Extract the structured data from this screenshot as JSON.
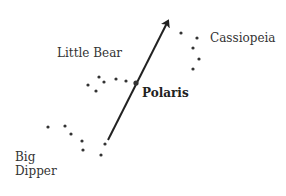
{
  "diagram": {
    "labels": {
      "cassiopeia": "Cassiopeia",
      "little_bear": "Little Bear",
      "polaris": "Polaris",
      "big_dipper_line1": "Big",
      "big_dipper_line2": "Dipper"
    },
    "arrow": {
      "from": [
        108,
        140
      ],
      "to": [
        170,
        17
      ],
      "color": "#222222"
    },
    "constellations": {
      "cassiopeia": [
        [
          181,
          33
        ],
        [
          197,
          38
        ],
        [
          193,
          48
        ],
        [
          199,
          59
        ],
        [
          193,
          69
        ]
      ],
      "little_bear": [
        [
          88,
          85
        ],
        [
          96,
          91
        ],
        [
          99,
          77
        ],
        [
          104,
          82
        ],
        [
          116,
          79
        ],
        [
          126,
          81
        ]
      ],
      "polaris": [
        136,
        83
      ],
      "big_dipper": [
        [
          48,
          127
        ],
        [
          65,
          126
        ],
        [
          71,
          134
        ],
        [
          82,
          141
        ],
        [
          83,
          150
        ],
        [
          105,
          144
        ],
        [
          101,
          155
        ]
      ]
    },
    "star_color": "#333333"
  }
}
